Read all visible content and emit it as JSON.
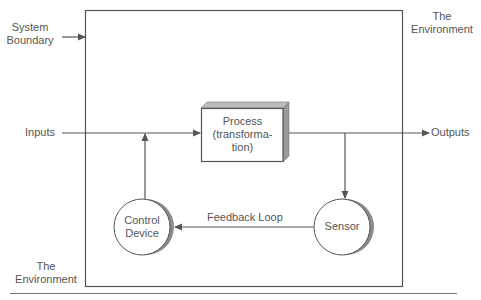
{
  "labels": {
    "system_boundary_line1": "System",
    "system_boundary_line2": "Boundary",
    "environment_top_line1": "The",
    "environment_top_line2": "Environment",
    "environment_bottom_line1": "The",
    "environment_bottom_line2": "Environment",
    "inputs": "Inputs",
    "outputs": "Outputs",
    "feedback_loop": "Feedback Loop"
  },
  "nodes": {
    "process": {
      "line1": "Process",
      "line2": "(transforma-",
      "line3": "tion)"
    },
    "control_device": {
      "line1": "Control",
      "line2": "Device"
    },
    "sensor": {
      "line1": "Sensor"
    }
  },
  "colors": {
    "line": "#555555",
    "shadow": "#8a8a8a",
    "box_side": "#9a9a9a",
    "box_top": "#bdbdbd",
    "text": "#555555"
  }
}
